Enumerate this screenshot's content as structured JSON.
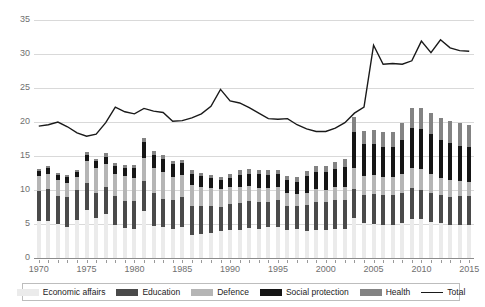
{
  "chart_data": {
    "type": "bar",
    "title": "",
    "subtitle": "",
    "xlabel": "",
    "ylabel": "",
    "stacked": true,
    "grid": true,
    "legend_position": "bottom",
    "ylim": [
      0,
      35
    ],
    "yticks": [
      0,
      5,
      10,
      15,
      20,
      25,
      30,
      35
    ],
    "xticks": [
      1970,
      1975,
      1980,
      1985,
      1990,
      1995,
      2000,
      2005,
      2010,
      2015
    ],
    "categories": [
      1970,
      1971,
      1972,
      1973,
      1974,
      1975,
      1976,
      1977,
      1978,
      1979,
      1980,
      1981,
      1982,
      1983,
      1984,
      1985,
      1986,
      1987,
      1988,
      1989,
      1990,
      1991,
      1992,
      1993,
      1994,
      1995,
      1996,
      1997,
      1998,
      1999,
      2000,
      2001,
      2002,
      2003,
      2004,
      2005,
      2006,
      2007,
      2008,
      2009,
      2010,
      2011,
      2012,
      2013,
      2014,
      2015
    ],
    "series": [
      {
        "name": "Economic affairs",
        "color": "#ebebeb",
        "values": [
          5.4,
          5.5,
          5.0,
          4.6,
          5.6,
          7.0,
          5.9,
          6.5,
          4.9,
          4.4,
          4.2,
          6.9,
          4.7,
          4.5,
          4.2,
          4.6,
          3.4,
          3.6,
          3.7,
          4.0,
          4.1,
          4.1,
          4.4,
          4.3,
          4.5,
          4.5,
          4.1,
          4.2,
          4.0,
          4.1,
          4.1,
          4.3,
          4.3,
          5.9,
          5.1,
          5.0,
          4.8,
          4.9,
          5.2,
          5.7,
          5.7,
          5.3,
          5.2,
          4.9,
          4.9,
          4.9
        ]
      },
      {
        "name": "Education",
        "color": "#4a4a4a",
        "values": [
          4.5,
          4.6,
          4.1,
          4.3,
          4.4,
          4.0,
          3.6,
          4.0,
          4.2,
          4.0,
          4.2,
          4.4,
          4.9,
          4.2,
          4.3,
          4.4,
          4.2,
          4.0,
          3.9,
          3.5,
          3.8,
          4.0,
          4.0,
          3.9,
          3.8,
          4.0,
          3.6,
          3.4,
          3.8,
          4.2,
          4.1,
          4.3,
          4.3,
          4.3,
          4.1,
          4.4,
          4.5,
          4.4,
          4.4,
          4.6,
          4.3,
          4.3,
          4.0,
          4.1,
          4.2,
          4.2
        ]
      },
      {
        "name": "Defence",
        "color": "#b5b5b5",
        "values": [
          2.2,
          2.3,
          2.3,
          2.2,
          1.9,
          3.3,
          3.7,
          3.3,
          3.3,
          3.6,
          3.3,
          3.4,
          3.7,
          3.9,
          3.4,
          3.2,
          3.2,
          2.9,
          2.7,
          2.6,
          2.5,
          2.4,
          2.2,
          2.1,
          2.0,
          1.9,
          1.9,
          1.8,
          1.8,
          1.8,
          1.8,
          1.8,
          1.9,
          3.0,
          2.9,
          2.8,
          2.6,
          2.6,
          2.8,
          3.0,
          3.1,
          2.8,
          2.6,
          2.4,
          2.2,
          2.1
        ]
      },
      {
        "name": "Social protection",
        "color": "#151515",
        "values": [
          0.7,
          0.9,
          0.8,
          0.8,
          0.7,
          0.9,
          1.0,
          1.1,
          1.2,
          1.3,
          1.5,
          2.4,
          1.9,
          2.0,
          1.9,
          1.7,
          1.6,
          1.5,
          1.4,
          1.3,
          1.4,
          1.7,
          1.8,
          2.0,
          1.9,
          1.9,
          1.8,
          1.8,
          2.4,
          2.5,
          2.6,
          2.7,
          2.9,
          5.3,
          4.6,
          4.5,
          4.4,
          4.4,
          4.9,
          5.8,
          5.9,
          5.8,
          5.6,
          5.5,
          5.2,
          5.1
        ]
      },
      {
        "name": "Health",
        "color": "#838383",
        "values": [
          0.3,
          0.3,
          0.3,
          0.3,
          0.3,
          0.4,
          0.4,
          0.5,
          0.4,
          0.4,
          0.5,
          0.6,
          0.6,
          0.6,
          0.5,
          0.5,
          0.5,
          0.5,
          0.5,
          0.5,
          0.6,
          0.7,
          0.7,
          0.7,
          0.7,
          0.7,
          0.7,
          0.7,
          0.8,
          0.9,
          0.9,
          1.0,
          1.1,
          2.2,
          2.0,
          2.1,
          2.2,
          2.3,
          2.5,
          2.9,
          3.0,
          3.1,
          3.2,
          3.3,
          3.4,
          3.3
        ]
      }
    ],
    "line_series": {
      "name": "Total",
      "color": "#1a1a1a",
      "values": [
        19.4,
        19.6,
        20.0,
        19.3,
        18.4,
        17.9,
        18.2,
        19.9,
        22.2,
        21.5,
        21.2,
        22.0,
        21.6,
        21.4,
        20.1,
        20.2,
        20.6,
        21.2,
        22.3,
        24.8,
        23.1,
        22.8,
        22.1,
        21.3,
        20.5,
        20.4,
        20.5,
        19.6,
        19.0,
        18.6,
        18.6,
        19.1,
        19.9,
        21.3,
        22.2,
        31.3,
        28.5,
        28.6,
        28.5,
        29.0,
        31.9,
        30.2,
        32.1,
        30.9,
        30.5,
        30.4
      ]
    }
  },
  "legend": {
    "items": [
      {
        "label": "Economic affairs",
        "type": "swatch",
        "color": "#ebebeb",
        "icon": "square-swatch-icon"
      },
      {
        "label": "Education",
        "type": "swatch",
        "color": "#4a4a4a",
        "icon": "square-swatch-icon"
      },
      {
        "label": "Defence",
        "type": "swatch",
        "color": "#b5b5b5",
        "icon": "square-swatch-icon"
      },
      {
        "label": "Social protection",
        "type": "swatch",
        "color": "#151515",
        "icon": "square-swatch-icon"
      },
      {
        "label": "Health",
        "type": "swatch",
        "color": "#838383",
        "icon": "square-swatch-icon"
      },
      {
        "label": "Total",
        "type": "line",
        "color": "#1a1a1a",
        "icon": "line-swatch-icon"
      }
    ]
  }
}
